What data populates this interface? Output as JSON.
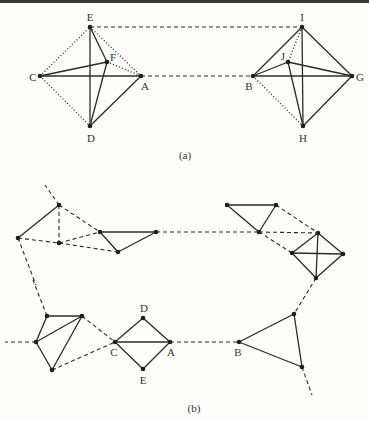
{
  "figure": {
    "panels": [
      {
        "caption": "(a)",
        "nodes": [
          {
            "id": "E",
            "label": "E",
            "x": 90,
            "y": 27,
            "lx": 90,
            "ly": 17
          },
          {
            "id": "F",
            "label": "F",
            "x": 107,
            "y": 62,
            "lx": 113,
            "ly": 57
          },
          {
            "id": "C",
            "label": "C",
            "x": 40,
            "y": 76,
            "lx": 33,
            "ly": 77
          },
          {
            "id": "A",
            "label": "A",
            "x": 141,
            "y": 76,
            "lx": 145,
            "ly": 86
          },
          {
            "id": "D",
            "label": "D",
            "x": 90,
            "y": 126,
            "lx": 91,
            "ly": 138
          },
          {
            "id": "I",
            "label": "I",
            "x": 302,
            "y": 27,
            "lx": 302,
            "ly": 17
          },
          {
            "id": "J",
            "label": "J",
            "x": 288,
            "y": 62,
            "lx": 283,
            "ly": 56
          },
          {
            "id": "B",
            "label": "B",
            "x": 253,
            "y": 76,
            "lx": 249,
            "ly": 86
          },
          {
            "id": "G",
            "label": "G",
            "x": 352,
            "y": 76,
            "lx": 360,
            "ly": 77
          },
          {
            "id": "H",
            "label": "H",
            "x": 303,
            "y": 126,
            "lx": 303,
            "ly": 138
          }
        ],
        "solid_edges": [
          [
            "E",
            "D"
          ],
          [
            "E",
            "F"
          ],
          [
            "F",
            "D"
          ],
          [
            "C",
            "F"
          ],
          [
            "C",
            "A"
          ],
          [
            "A",
            "D"
          ],
          [
            "I",
            "H"
          ],
          [
            "I",
            "B"
          ],
          [
            "I",
            "G"
          ],
          [
            "B",
            "J"
          ],
          [
            "J",
            "G"
          ],
          [
            "J",
            "H"
          ],
          [
            "B",
            "G"
          ],
          [
            "G",
            "H"
          ]
        ],
        "dotted_edges": [
          [
            "C",
            "E"
          ],
          [
            "C",
            "D"
          ],
          [
            "E",
            "A"
          ],
          [
            "F",
            "A"
          ],
          [
            "I",
            "J"
          ],
          [
            "B",
            "H"
          ]
        ],
        "dashed_edges": [
          [
            "E",
            "I"
          ],
          [
            "A",
            "B"
          ]
        ],
        "caption_pos": {
          "x": 185,
          "y": 155
        }
      },
      {
        "caption": "(b)",
        "nodes": [
          {
            "id": "n1",
            "label": "",
            "x": 18,
            "y": 238
          },
          {
            "id": "n2",
            "label": "",
            "x": 59,
            "y": 205
          },
          {
            "id": "n3",
            "label": "",
            "x": 59,
            "y": 243
          },
          {
            "id": "n4",
            "label": "",
            "x": 100,
            "y": 232
          },
          {
            "id": "n5",
            "label": "",
            "x": 118,
            "y": 252
          },
          {
            "id": "n6",
            "label": "",
            "x": 156,
            "y": 232
          },
          {
            "id": "t1",
            "label": "",
            "x": 227,
            "y": 205
          },
          {
            "id": "t2",
            "label": "",
            "x": 276,
            "y": 205
          },
          {
            "id": "t3",
            "label": "",
            "x": 259,
            "y": 232
          },
          {
            "id": "s1",
            "label": "",
            "x": 318,
            "y": 233
          },
          {
            "id": "s2",
            "label": "",
            "x": 292,
            "y": 253
          },
          {
            "id": "s3",
            "label": "",
            "x": 343,
            "y": 254
          },
          {
            "id": "s4",
            "label": "",
            "x": 316,
            "y": 278
          },
          {
            "id": "p1",
            "label": "",
            "x": 47,
            "y": 316
          },
          {
            "id": "p2",
            "label": "",
            "x": 82,
            "y": 316
          },
          {
            "id": "p3",
            "label": "",
            "x": 36,
            "y": 342
          },
          {
            "id": "p4",
            "label": "",
            "x": 52,
            "y": 370
          },
          {
            "id": "C",
            "label": "C",
            "x": 115,
            "y": 342,
            "lx": 114,
            "ly": 352
          },
          {
            "id": "D",
            "label": "D",
            "x": 143,
            "y": 318,
            "lx": 144,
            "ly": 308
          },
          {
            "id": "A",
            "label": "A",
            "x": 170,
            "y": 342,
            "lx": 171,
            "ly": 352
          },
          {
            "id": "E",
            "label": "E",
            "x": 143,
            "y": 369,
            "lx": 143,
            "ly": 380
          },
          {
            "id": "B",
            "label": "B",
            "x": 239,
            "y": 342,
            "lx": 238,
            "ly": 352
          },
          {
            "id": "q2",
            "label": "",
            "x": 294,
            "y": 314
          },
          {
            "id": "q3",
            "label": "",
            "x": 302,
            "y": 367
          }
        ],
        "solid_edges": [
          [
            "n1",
            "n2"
          ],
          [
            "n4",
            "n6"
          ],
          [
            "n4",
            "n5"
          ],
          [
            "n5",
            "n6"
          ],
          [
            "t1",
            "t2"
          ],
          [
            "t1",
            "t3"
          ],
          [
            "t2",
            "t3"
          ],
          [
            "s1",
            "s2"
          ],
          [
            "s1",
            "s3"
          ],
          [
            "s1",
            "s4"
          ],
          [
            "s2",
            "s3"
          ],
          [
            "s2",
            "s4"
          ],
          [
            "s3",
            "s4"
          ],
          [
            "p1",
            "p2"
          ],
          [
            "p1",
            "p3"
          ],
          [
            "p2",
            "p3"
          ],
          [
            "p2",
            "p4"
          ],
          [
            "p3",
            "p4"
          ],
          [
            "C",
            "D"
          ],
          [
            "D",
            "A"
          ],
          [
            "C",
            "A"
          ],
          [
            "C",
            "E"
          ],
          [
            "E",
            "A"
          ],
          [
            "B",
            "q2"
          ],
          [
            "B",
            "q3"
          ],
          [
            "q2",
            "q3"
          ]
        ],
        "dashed_edges": [
          [
            "n2",
            "n3"
          ],
          [
            "n1",
            "n3"
          ],
          [
            "n2",
            "n4"
          ],
          [
            "n3",
            "n4"
          ],
          [
            "n3",
            "n5"
          ],
          [
            "n6",
            "t3"
          ],
          [
            "t3",
            "s1"
          ],
          [
            "t2",
            "s1"
          ],
          [
            "t3",
            "s2"
          ],
          [
            "s4",
            "q2"
          ],
          [
            "p2",
            "C"
          ],
          [
            "p4",
            "C"
          ],
          [
            "A",
            "B"
          ]
        ],
        "dangling_dashed": [
          {
            "from": "n2",
            "to": [
              45,
              185
            ]
          },
          {
            "from": "n1",
            "to": [
              36,
              285
            ]
          },
          {
            "from": "p1",
            "to": [
              33,
              280
            ]
          },
          {
            "from": "p3",
            "to": [
              5,
              342
            ]
          },
          {
            "from": "q3",
            "to": [
              312,
              395
            ]
          }
        ],
        "caption_pos": {
          "x": 194,
          "y": 408
        }
      }
    ]
  },
  "style": {
    "line_color": "#2b2b2b",
    "node_color": "#1e1e1e",
    "background": "#fdfdfb"
  }
}
